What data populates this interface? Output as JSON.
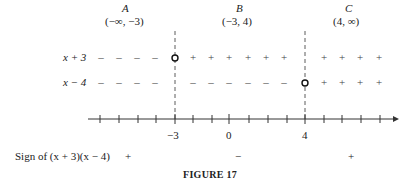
{
  "intervals": [
    {
      "name": "A",
      "range": "(−∞, −3)",
      "cx": 127
    },
    {
      "name": "B",
      "range": "(−3, 4)",
      "cx": 240
    },
    {
      "name": "C",
      "range": "(4, ∞)",
      "cx": 349
    }
  ],
  "factors": [
    {
      "label": "x + 3",
      "y": 57,
      "signs_A": "−",
      "signs_B": "+",
      "signs_C": "+",
      "zero_at": -3
    },
    {
      "label": "x − 4",
      "y": 82,
      "signs_A": "−",
      "signs_B": "−",
      "signs_C": "+",
      "zero_at": 4
    }
  ],
  "axis": {
    "tick_labels": [
      "−3",
      "0",
      "4"
    ],
    "critical_points": [
      -3,
      4
    ]
  },
  "sign_row": {
    "label": "Sign of (x + 3)(x − 4)",
    "signs": [
      "+",
      "−",
      "+"
    ]
  },
  "caption": "FIGURE 17"
}
